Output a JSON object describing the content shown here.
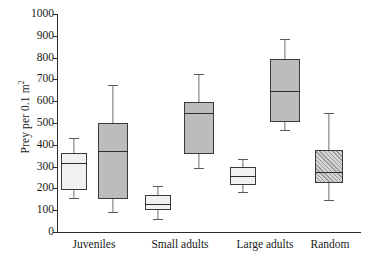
{
  "chart_data": {
    "type": "box",
    "title": "",
    "xlabel": "",
    "ylabel": "Prey per 0.1 m",
    "ylabel_superscript": "2",
    "ylim": [
      0,
      1000
    ],
    "ytick_values": [
      1000,
      900,
      800,
      700,
      600,
      500,
      400,
      300,
      200,
      100,
      0
    ],
    "ytick_labels": [
      "1000",
      "900",
      "800",
      "700",
      "600",
      "500",
      "400",
      "300",
      "200",
      "100",
      "0"
    ],
    "grid": false,
    "legend": "none",
    "categories": [
      "Juveniles",
      "Small adults",
      "Large adults",
      "Random"
    ],
    "boxes": [
      {
        "name": "juveniles-white",
        "category": "Juveniles",
        "fill": "#f1f1f1",
        "pattern": "solid",
        "whisker_high": 431,
        "q3": 362,
        "median": 317,
        "q1": 193,
        "whisker_low": 156
      },
      {
        "name": "juveniles-gray",
        "category": "Juveniles",
        "fill": "#bcbcbc",
        "pattern": "solid",
        "whisker_high": 674,
        "q3": 500,
        "median": 372,
        "q1": 151,
        "whisker_low": 92
      },
      {
        "name": "small-adults-white",
        "category": "Small adults",
        "fill": "#f1f1f1",
        "pattern": "solid",
        "whisker_high": 211,
        "q3": 170,
        "median": 128,
        "q1": 101,
        "whisker_low": 60
      },
      {
        "name": "small-adults-gray",
        "category": "Small adults",
        "fill": "#bcbcbc",
        "pattern": "solid",
        "whisker_high": 725,
        "q3": 596,
        "median": 546,
        "q1": 358,
        "whisker_low": 294
      },
      {
        "name": "large-adults-white",
        "category": "Large adults",
        "fill": "#f1f1f1",
        "pattern": "solid",
        "whisker_high": 335,
        "q3": 298,
        "median": 257,
        "q1": 216,
        "whisker_low": 183
      },
      {
        "name": "large-adults-gray",
        "category": "Large adults",
        "fill": "#bcbcbc",
        "pattern": "solid",
        "whisker_high": 885,
        "q3": 794,
        "median": 647,
        "q1": 505,
        "whisker_low": 468
      },
      {
        "name": "random-hatched",
        "category": "Random",
        "fill": "#d5d5d5",
        "pattern": "diagonal-hatch",
        "whisker_high": 546,
        "q3": 376,
        "median": 275,
        "q1": 225,
        "whisker_low": 147
      }
    ]
  },
  "axis": {
    "y_title_text": "Prey per 0.1 m",
    "y_title_sup": "2"
  }
}
